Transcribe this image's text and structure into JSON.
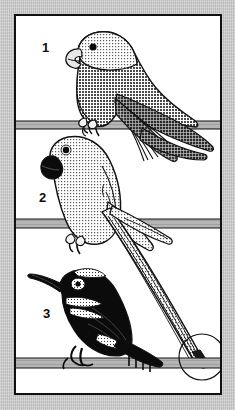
{
  "plate": {
    "title": "Bird identification plate",
    "description": "Three perched birds illustrated on horizontal branches, numbered 1 to 3, with a circled detail at lower right.",
    "background_color": "#cccccc",
    "panel_color": "#ffffff",
    "ink_color": "#111111",
    "perch_color": "#b3b3b3",
    "frame": {
      "x": 14,
      "y": 14,
      "width": 208,
      "height": 381,
      "border_width": 2
    }
  },
  "labels": [
    {
      "id": "1",
      "text": "1",
      "x": 40,
      "y": 46
    },
    {
      "id": "2",
      "text": "2",
      "x": 37,
      "y": 196
    },
    {
      "id": "3",
      "text": "3",
      "x": 41,
      "y": 312
    }
  ],
  "perches": [
    {
      "id": "perch-top",
      "y": 121,
      "height": 8
    },
    {
      "id": "perch-middle",
      "y": 219,
      "height": 9
    },
    {
      "id": "perch-bottom",
      "y": 358,
      "height": 10
    }
  ],
  "birds": [
    {
      "id": "bird-1",
      "number": "1",
      "perch": "perch-top",
      "head_tone": "light-stipple",
      "body_tone": "mid-stipple",
      "wing_tone": "dark-hatch",
      "eye": "black-dot",
      "bill": "light-pale",
      "posture": "perched facing left, long pointed wing sweeping down-right"
    },
    {
      "id": "bird-2",
      "number": "2",
      "perch": "perch-middle",
      "head_tone": "light-stipple",
      "body_tone": "light-stipple",
      "wing_tone": "light-stipple",
      "eye": "black-dot",
      "bill": "black-solid",
      "posture": "perched facing upper-left, very long tapering tail to lower right"
    },
    {
      "id": "bird-3",
      "number": "3",
      "perch": "perch-bottom",
      "head_tone": "black-solid",
      "body_tone": "black-solid",
      "wing_tone": "black-solid",
      "markings": "white-speckled-bands",
      "eye": "white-ring",
      "bill": "long-decurved-black",
      "posture": "perched facing left on lowest branch"
    }
  ],
  "annotations": [
    {
      "id": "detail-circle",
      "shape": "circle",
      "cx": 200,
      "cy": 355,
      "r": 23,
      "purpose": "circled tail-tip detail"
    }
  ]
}
